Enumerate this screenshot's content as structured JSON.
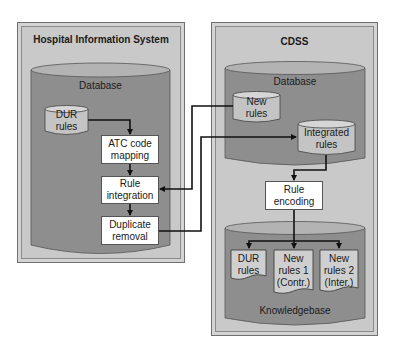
{
  "his": {
    "title": "Hospital Information System",
    "database_label": "Database",
    "dur_rules": "DUR\nrules",
    "steps": [
      {
        "id": "atc",
        "label": "ATC code mapping"
      },
      {
        "id": "integration",
        "label": "Rule integration"
      },
      {
        "id": "dedup",
        "label": "Duplicate removal"
      }
    ]
  },
  "cdss": {
    "title": "CDSS",
    "database_label": "Database",
    "new_rules": "New rules",
    "integrated_rules": "Integrated rules",
    "rule_encoding": "Rule encoding",
    "knowledgebase_label": "Knowledgebase",
    "kb_docs": [
      {
        "line1": "DUR",
        "line2": "rules",
        "line3": ""
      },
      {
        "line1": "New",
        "line2": "rules 1",
        "line3": "(Contr.)"
      },
      {
        "line1": "New",
        "line2": "rules 2",
        "line3": "(Inter.)"
      }
    ]
  },
  "colors": {
    "panel_bg": "#c9c9c9",
    "db_body": "#8e8e8e",
    "db_top": "#b3b3b3",
    "small_cyl": "#c4c4c4",
    "doc_fill": "#cfcfcf",
    "line": "#111111"
  },
  "labels": {
    "dur_l1": "DUR",
    "dur_l2": "rules",
    "atc_l1": "ATC code",
    "atc_l2": "mapping",
    "int_l1": "Rule",
    "int_l2": "integration",
    "dup_l1": "Duplicate",
    "dup_l2": "removal",
    "new_l1": "New",
    "new_l2": "rules",
    "ir_l1": "Integrated",
    "ir_l2": "rules",
    "enc_l1": "Rule",
    "enc_l2": "encoding"
  }
}
